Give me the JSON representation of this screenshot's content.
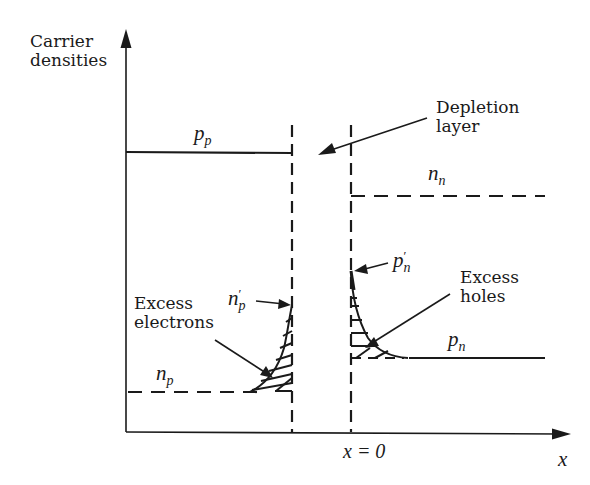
{
  "figure": {
    "y_axis_label_line1": "Carrier",
    "y_axis_label_line2": "densities",
    "x_axis_label": "x",
    "origin_label": "x = 0",
    "depletion_label_line1": "Depletion",
    "depletion_label_line2": "layer",
    "excess_electrons_line1": "Excess",
    "excess_electrons_line2": "electrons",
    "excess_holes_line1": "Excess",
    "excess_holes_line2": "holes",
    "pp_base": "p",
    "pp_sub": "p",
    "nn_base": "n",
    "nn_sub": "n",
    "np_base": "n",
    "np_sub": "p",
    "pn_base": "p",
    "pn_sub": "n",
    "np_prime_base": "n",
    "np_prime_sup": "′",
    "np_prime_sub": "p",
    "pn_prime_base": "p",
    "pn_prime_sup": "′",
    "pn_prime_sub": "n"
  },
  "colors": {
    "ink": "#1a1a1a",
    "background": "#ffffff"
  }
}
